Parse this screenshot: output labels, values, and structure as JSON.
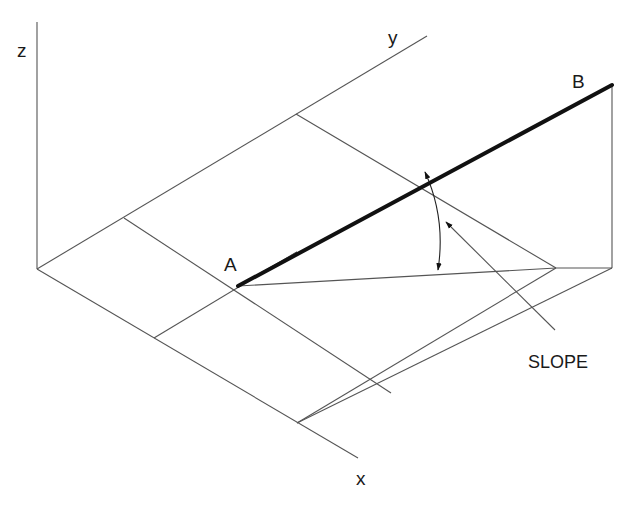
{
  "diagram": {
    "labels": {
      "z_axis": "z",
      "y_axis": "y",
      "x_axis": "x",
      "point_a": "A",
      "point_b": "B",
      "slope": "SLOPE"
    },
    "colors": {
      "background": "#ffffff",
      "thin_line": "#555555",
      "bold_line": "#111111",
      "text": "#1a1a1a"
    }
  }
}
